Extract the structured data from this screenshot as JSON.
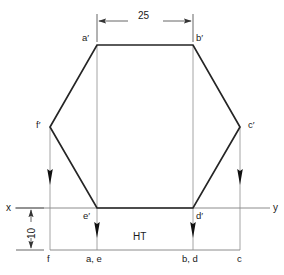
{
  "drawing": {
    "title": "Orthographic projection of a hexagon",
    "colors": {
      "outline": "#222222",
      "projector": "#8a8a8a",
      "dimension": "#555555",
      "text": "#1a1a1a",
      "background": "#ffffff"
    },
    "dimensions": {
      "width_label": "25",
      "height_label": "10"
    },
    "axis": {
      "x_label": "x",
      "y_label": "y"
    },
    "trace": {
      "label": "HT"
    },
    "front_view_labels": [
      {
        "name": "a-prime",
        "text": "a′",
        "x": 82,
        "y": 33
      },
      {
        "name": "b-prime",
        "text": "b′",
        "x": 196,
        "y": 33
      },
      {
        "name": "c-prime",
        "text": "c′",
        "x": 248,
        "y": 120
      },
      {
        "name": "d-prime",
        "text": "d′",
        "x": 196,
        "y": 211
      },
      {
        "name": "e-prime",
        "text": "e′",
        "x": 83,
        "y": 211
      },
      {
        "name": "f-prime",
        "text": "f′",
        "x": 36,
        "y": 120
      }
    ],
    "top_view_labels": [
      {
        "name": "point-f",
        "text": "f",
        "x": 47,
        "y": 254
      },
      {
        "name": "point-a-e",
        "text": "a, e",
        "x": 86,
        "y": 254
      },
      {
        "name": "point-b-d",
        "text": "b, d",
        "x": 182,
        "y": 254
      },
      {
        "name": "point-c",
        "text": "c",
        "x": 237,
        "y": 254
      }
    ],
    "geometry": {
      "hexagon": [
        {
          "name": "a-prime",
          "x": 97,
          "y": 45
        },
        {
          "name": "b-prime",
          "x": 193,
          "y": 45
        },
        {
          "name": "c-prime",
          "x": 240,
          "y": 127
        },
        {
          "name": "d-prime",
          "x": 193,
          "y": 208
        },
        {
          "name": "e-prime",
          "x": 97,
          "y": 208
        },
        {
          "name": "f-prime",
          "x": 50,
          "y": 127
        }
      ],
      "xy_line": {
        "x1": 15,
        "y1": 208,
        "x2": 270,
        "y2": 208
      },
      "ht_line": {
        "x1": 50,
        "y1": 250,
        "x2": 240,
        "y2": 250
      },
      "projectors": [
        {
          "name": "projector-f",
          "x": 50,
          "y1": 127,
          "y2": 250,
          "arrow_y": 180
        },
        {
          "name": "projector-a-e",
          "x": 97,
          "y1": 45,
          "y2": 250,
          "arrow_y": 232
        },
        {
          "name": "projector-b-d",
          "x": 193,
          "y1": 45,
          "y2": 250,
          "arrow_y": 232
        },
        {
          "name": "projector-c",
          "x": 240,
          "y1": 127,
          "y2": 250,
          "arrow_y": 180
        }
      ],
      "width_dimension": {
        "x1": 97,
        "x2": 193,
        "y": 21,
        "ext_top": 14,
        "ext_bottom": 45
      },
      "height_dimension": {
        "x": 31,
        "y1": 208,
        "y2": 250
      }
    }
  }
}
